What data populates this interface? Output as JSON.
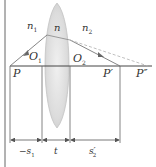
{
  "diagram": {
    "type": "thick-lens-refraction",
    "colors": {
      "background": "#ffffff",
      "line": "#555555",
      "axis": "#444444",
      "ray": "#777777",
      "dashed_ray": "#aaaaaa",
      "lens_fill": "#d8d8d8",
      "lens_edge": "#bdbdbd",
      "text": "#333333"
    },
    "labels": {
      "n1": "n",
      "n1_sub": "1",
      "n": "n",
      "n2": "n",
      "n2_sub": "2",
      "O1": "O",
      "O1_sub": "1",
      "O2": "O",
      "O2_sub": "2",
      "P": "P",
      "P_prime": "P′",
      "P_double_prime": "P″",
      "minus_s1": "−s",
      "minus_s1_sub": "1",
      "t": "t",
      "s2_prime": "s′",
      "s2_prime_sub": "2"
    },
    "dimensions": [
      {
        "name": "object-distance",
        "label": "−s1"
      },
      {
        "name": "lens-thickness",
        "label": "t"
      },
      {
        "name": "image-distance",
        "label": "s′2"
      }
    ]
  }
}
